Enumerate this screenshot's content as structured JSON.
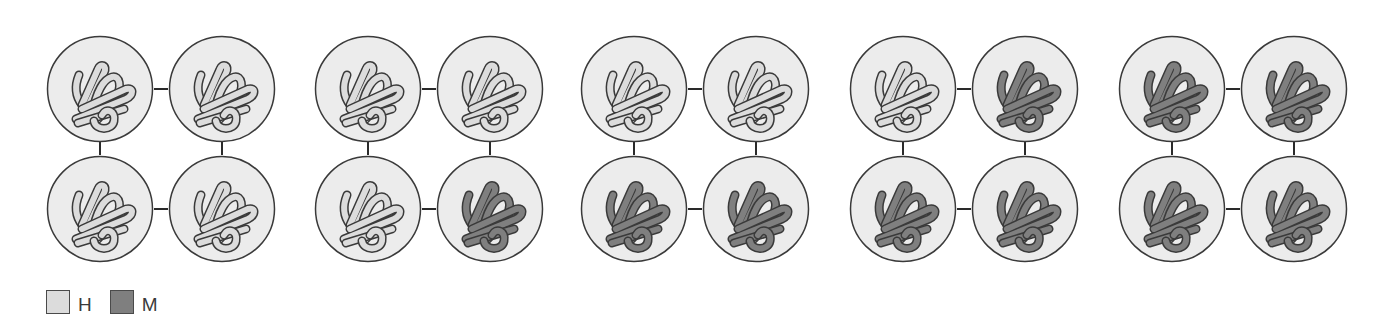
{
  "figure": {
    "colors": {
      "H": "#dcdcdc",
      "M": "#7f7f7f",
      "circle_fill": "#ececec",
      "outline": "#3a3a3a"
    },
    "tetramers": [
      {
        "subunits": [
          "H",
          "H",
          "H",
          "H"
        ]
      },
      {
        "subunits": [
          "H",
          "H",
          "H",
          "M"
        ]
      },
      {
        "subunits": [
          "H",
          "H",
          "M",
          "M"
        ]
      },
      {
        "subunits": [
          "H",
          "M",
          "M",
          "M"
        ]
      },
      {
        "subunits": [
          "M",
          "M",
          "M",
          "M"
        ]
      }
    ]
  },
  "legend": {
    "items": [
      {
        "key": "H",
        "label": "H",
        "color": "#dcdcdc"
      },
      {
        "key": "M",
        "label": "M",
        "color": "#7f7f7f"
      }
    ]
  }
}
